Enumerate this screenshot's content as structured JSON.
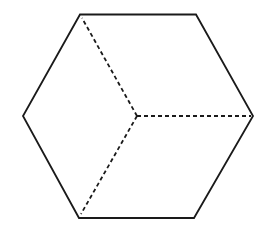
{
  "diagram": {
    "type": "hexagon-cube-projection",
    "stroke_color": "#1a1a1a",
    "background": "#ffffff",
    "outer_vertices": [
      {
        "x": 80,
        "y": 14.5
      },
      {
        "x": 196,
        "y": 14.5
      },
      {
        "x": 253,
        "y": 116
      },
      {
        "x": 194,
        "y": 218
      },
      {
        "x": 79,
        "y": 218
      },
      {
        "x": 23,
        "y": 116
      }
    ],
    "center": {
      "x": 137,
      "y": 116
    },
    "hidden_edges": [
      {
        "from": "center",
        "to": {
          "x": 80,
          "y": 14.5
        }
      },
      {
        "from": "center",
        "to": {
          "x": 253,
          "y": 116
        }
      },
      {
        "from": "center",
        "to": {
          "x": 79,
          "y": 218
        }
      }
    ]
  }
}
